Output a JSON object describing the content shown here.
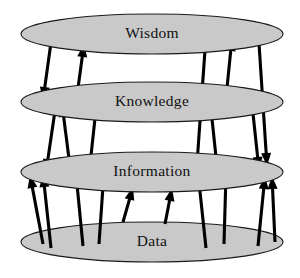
{
  "diagram": {
    "type": "layered-ellipse-diagram",
    "canvas": {
      "width": 300,
      "height": 278,
      "background": "#ffffff"
    },
    "colors": {
      "tier_fill": "#c9c9c9",
      "tier_stroke": "#1a1a1a",
      "arrow": "#000000",
      "label_text": "#111111"
    },
    "tiers": [
      {
        "id": "wisdom",
        "label": "Wisdom",
        "level": 4,
        "cx": 152,
        "cy": 34,
        "rx": 131,
        "ry": 20,
        "label_x": 152,
        "label_y": 34
      },
      {
        "id": "knowledge",
        "label": "Knowledge",
        "level": 3,
        "cx": 152,
        "cy": 102,
        "rx": 131,
        "ry": 20,
        "label_x": 152,
        "label_y": 102
      },
      {
        "id": "information",
        "label": "Information",
        "level": 2,
        "cx": 152,
        "cy": 172,
        "rx": 131,
        "ry": 20,
        "label_x": 152,
        "label_y": 172
      },
      {
        "id": "data",
        "label": "Data",
        "level": 1,
        "cx": 152,
        "cy": 242,
        "rx": 131,
        "ry": 20,
        "label_x": 152,
        "label_y": 242
      }
    ],
    "arrows": [
      {
        "id": "a1",
        "from": "wisdom",
        "to": "knowledge",
        "direction": "down",
        "x1": 53,
        "y1": 28,
        "x2": 43,
        "y2": 100,
        "width": 3.1
      },
      {
        "id": "a2",
        "from": "knowledge",
        "to": "wisdom",
        "direction": "up",
        "x1": 76,
        "y1": 103,
        "x2": 84,
        "y2": 44,
        "width": 3.1
      },
      {
        "id": "a3",
        "from": "information",
        "to": "wisdom",
        "direction": "up",
        "x1": 196,
        "y1": 178,
        "x2": 206,
        "y2": 36,
        "width": 3.1
      },
      {
        "id": "a4",
        "from": "knowledge",
        "to": "wisdom",
        "direction": "up",
        "x1": 224,
        "y1": 118,
        "x2": 232,
        "y2": 38,
        "width": 3.1
      },
      {
        "id": "a5",
        "from": "wisdom",
        "to": "information",
        "direction": "down",
        "x1": 258,
        "y1": 28,
        "x2": 267,
        "y2": 166,
        "width": 3.1
      },
      {
        "id": "a6",
        "from": "knowledge",
        "to": "information",
        "direction": "down",
        "x1": 56,
        "y1": 104,
        "x2": 46,
        "y2": 172,
        "width": 3.1
      },
      {
        "id": "a7",
        "from": "information",
        "to": "knowledge",
        "direction": "up",
        "x1": 72,
        "y1": 182,
        "x2": 62,
        "y2": 104,
        "width": 3.1
      },
      {
        "id": "a8",
        "from": "information",
        "to": "knowledge",
        "direction": "up",
        "x1": 89,
        "y1": 174,
        "x2": 97,
        "y2": 100,
        "width": 3.1
      },
      {
        "id": "a9",
        "from": "information",
        "to": "knowledge",
        "direction": "up",
        "x1": 218,
        "y1": 176,
        "x2": 210,
        "y2": 100,
        "width": 3.1
      },
      {
        "id": "a10",
        "from": "knowledge",
        "to": "information",
        "direction": "down",
        "x1": 252,
        "y1": 104,
        "x2": 259,
        "y2": 170,
        "width": 3.1
      },
      {
        "id": "a11",
        "from": "data",
        "to": "information",
        "direction": "up",
        "x1": 43,
        "y1": 244,
        "x2": 30,
        "y2": 175,
        "width": 3.1
      },
      {
        "id": "a12",
        "from": "data",
        "to": "knowledge",
        "direction": "up",
        "x1": 51,
        "y1": 248,
        "x2": 43,
        "y2": 174,
        "width": 3.1
      },
      {
        "id": "a13",
        "from": "data",
        "to": "information",
        "direction": "up",
        "x1": 83,
        "y1": 246,
        "x2": 76,
        "y2": 174,
        "width": 3.1
      },
      {
        "id": "a14",
        "from": "data",
        "to": "information",
        "direction": "up",
        "x1": 99,
        "y1": 244,
        "x2": 104,
        "y2": 172,
        "width": 3.1
      },
      {
        "id": "a15",
        "from": "data",
        "to": "information",
        "direction": "up",
        "x1": 123,
        "y1": 222,
        "x2": 133,
        "y2": 187,
        "width": 3.1
      },
      {
        "id": "a16",
        "from": "data",
        "to": "information",
        "direction": "up",
        "x1": 165,
        "y1": 224,
        "x2": 172,
        "y2": 188,
        "width": 3.1
      },
      {
        "id": "a17",
        "from": "data",
        "to": "information",
        "direction": "up",
        "x1": 206,
        "y1": 248,
        "x2": 198,
        "y2": 173,
        "width": 3.1
      },
      {
        "id": "a18",
        "from": "data",
        "to": "information",
        "direction": "up",
        "x1": 224,
        "y1": 244,
        "x2": 226,
        "y2": 174,
        "width": 3.1
      },
      {
        "id": "a19",
        "from": "data",
        "to": "information",
        "direction": "up",
        "x1": 258,
        "y1": 246,
        "x2": 265,
        "y2": 176,
        "width": 3.1
      },
      {
        "id": "a20",
        "from": "data",
        "to": "information",
        "direction": "up",
        "x1": 275,
        "y1": 242,
        "x2": 272,
        "y2": 176,
        "width": 3.1
      }
    ]
  }
}
